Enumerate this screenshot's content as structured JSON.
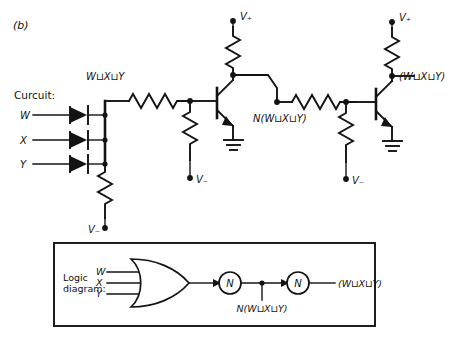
{
  "figure": {
    "panel_label": "(b)",
    "width": 452,
    "height": 345,
    "ink_color": "#131313",
    "background": "#ffffff"
  },
  "circuit": {
    "section_label": "Curcuit:",
    "inputs": [
      {
        "name": "W",
        "label": "W"
      },
      {
        "name": "X",
        "label": "X"
      },
      {
        "name": "Y",
        "label": "Y"
      }
    ],
    "node_labels": {
      "or_output": "W⊔X⊔Y",
      "first_stage_output": "N(W⊔X⊔Y)",
      "final_output": "(W⊔X⊔Y)"
    },
    "supplies": {
      "positive": "V₊",
      "negative": "V₋"
    },
    "component_names": {
      "diode": "diode",
      "resistor": "resistor",
      "transistor": "npn-transistor",
      "ground": "ground-symbol"
    },
    "supply_rails": [
      {
        "name": "vplus-stage1",
        "label": "V₊"
      },
      {
        "name": "vplus-stage2",
        "label": "V₊"
      }
    ],
    "negative_rails": [
      {
        "name": "vminus-input",
        "label": "V₋"
      },
      {
        "name": "vminus-stage1",
        "label": "V₋"
      },
      {
        "name": "vminus-stage2",
        "label": "V₋"
      }
    ]
  },
  "logic_diagram": {
    "section_label_line1": "Logic",
    "section_label_line2": "diagram:",
    "inputs": [
      {
        "name": "W",
        "label": "W"
      },
      {
        "name": "X",
        "label": "X"
      },
      {
        "name": "Y",
        "label": "Y"
      }
    ],
    "or_gate": {
      "name": "or-gate",
      "type": "OR"
    },
    "inverters": [
      {
        "name": "inverter-1",
        "label": "N"
      },
      {
        "name": "inverter-2",
        "label": "N"
      }
    ],
    "intermediate_label": "N(W⊔X⊔Y)",
    "output_label": "(W⊔X⊔Y)"
  }
}
